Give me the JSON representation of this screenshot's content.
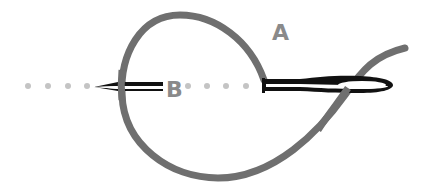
{
  "diagram": {
    "labels": {
      "a": "A",
      "b": "B"
    },
    "colors": {
      "thread": "#6f6f6f",
      "dots": "#c4c4c4",
      "needle": "#111111",
      "label": "#8a8a8a",
      "background": "#ffffff"
    }
  }
}
